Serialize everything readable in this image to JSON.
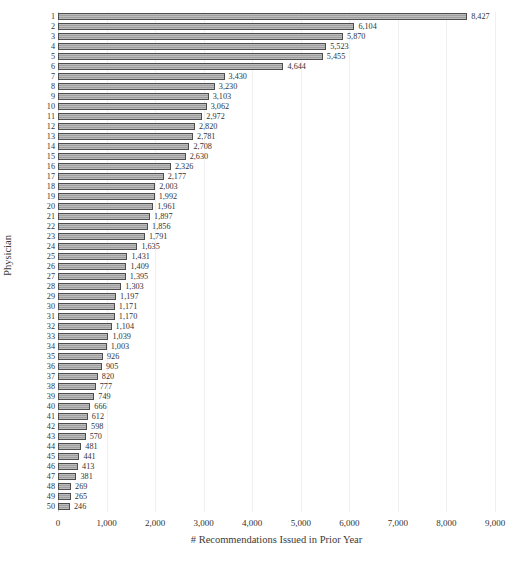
{
  "caption": {
    "faint_top_strip": ""
  },
  "chart_data": {
    "type": "bar",
    "orientation": "horizontal",
    "title": "",
    "xlabel": "# Recommendations Issued in Prior Year",
    "ylabel": "Physician",
    "xlim": [
      0,
      9000
    ],
    "grid": true,
    "legend": "none",
    "xticks": [
      "0",
      "1,000",
      "2,000",
      "3,000",
      "4,000",
      "5,000",
      "6,000",
      "7,000",
      "8,000",
      "9,000"
    ],
    "xtick_values": [
      0,
      1000,
      2000,
      3000,
      4000,
      5000,
      6000,
      7000,
      8000,
      9000
    ],
    "categories": [
      "1",
      "2",
      "3",
      "4",
      "5",
      "6",
      "7",
      "8",
      "9",
      "10",
      "11",
      "12",
      "13",
      "14",
      "15",
      "16",
      "17",
      "18",
      "19",
      "20",
      "21",
      "22",
      "23",
      "24",
      "25",
      "26",
      "27",
      "28",
      "29",
      "30",
      "31",
      "32",
      "33",
      "34",
      "35",
      "36",
      "37",
      "38",
      "39",
      "40",
      "41",
      "42",
      "43",
      "44",
      "45",
      "46",
      "47",
      "48",
      "49",
      "50"
    ],
    "values": [
      8427,
      6104,
      5870,
      5523,
      5455,
      4644,
      3430,
      3230,
      3103,
      3062,
      2972,
      2820,
      2781,
      2708,
      2630,
      2326,
      2177,
      2003,
      1992,
      1961,
      1897,
      1856,
      1791,
      1635,
      1431,
      1409,
      1395,
      1303,
      1197,
      1171,
      1170,
      1104,
      1039,
      1003,
      926,
      905,
      820,
      777,
      749,
      666,
      612,
      598,
      570,
      481,
      441,
      413,
      381,
      269,
      265,
      246
    ],
    "value_labels": [
      "8,427",
      "6,104",
      "5,870",
      "5,523",
      "5,455",
      "4,644",
      "3,430",
      "3,230",
      "3,103",
      "3,062",
      "2,972",
      "2,820",
      "2,781",
      "2,708",
      "2,630",
      "2,326",
      "2,177",
      "2,003",
      "1,992",
      "1,961",
      "1,897",
      "1,856",
      "1,791",
      "1,635",
      "1,431",
      "1,409",
      "1,395",
      "1,303",
      "1,197",
      "1,171",
      "1,170",
      "1,104",
      "1,039",
      "1,003",
      "926",
      "905",
      "820",
      "777",
      "749",
      "666",
      "612",
      "598",
      "570",
      "481",
      "441",
      "413",
      "381",
      "269",
      "265",
      "246"
    ],
    "bar_fill_color": "#9f9f9f",
    "bar_border_color": "#4d4d4d",
    "gridline_color": "#f0f0f2",
    "text_color": "#333333"
  }
}
